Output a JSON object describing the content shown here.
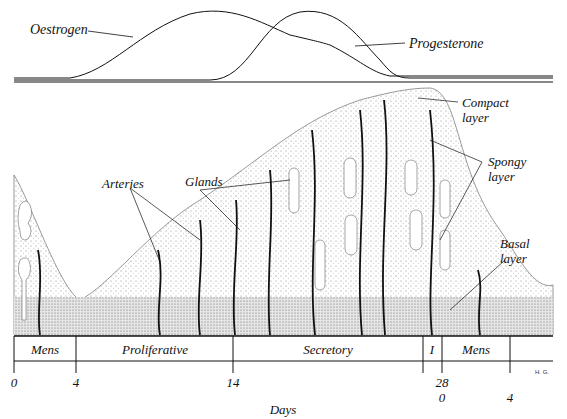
{
  "hormones": {
    "oestrogen_label": "Oestrogen",
    "progesterone_label": "Progesterone"
  },
  "endometrium": {
    "labels": {
      "glands": "Glands",
      "arteries": "Arteries",
      "compact": "Compact",
      "compact2": "layer",
      "spongy": "Spongy",
      "spongy2": "layer",
      "basal": "Basal",
      "basal2": "layer"
    }
  },
  "phases": [
    {
      "label": "Mens"
    },
    {
      "label": "Proliferative"
    },
    {
      "label": "Secretory"
    },
    {
      "label": "I"
    },
    {
      "label": "Mens"
    }
  ],
  "axis": {
    "ticks": [
      "0",
      "4",
      "14",
      "28",
      "0",
      "4"
    ],
    "label": "Days",
    "signature": "H. G."
  },
  "colors": {
    "ink": "#111111",
    "stipple": "#bdbdbd",
    "basal": "#d0d0d0"
  }
}
